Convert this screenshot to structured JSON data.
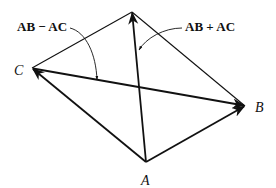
{
  "diagram": {
    "type": "vector-parallelogram",
    "vertices": {
      "A": {
        "label": "A",
        "x": 146,
        "y": 162
      },
      "B": {
        "label": "B",
        "x": 245,
        "y": 106
      },
      "C": {
        "label": "C",
        "x": 32,
        "y": 68
      },
      "D": {
        "label": "",
        "x": 132,
        "y": 12
      }
    },
    "vectors": [
      {
        "name": "AB",
        "from": "A",
        "to": "B",
        "arrow": true
      },
      {
        "name": "AC",
        "from": "A",
        "to": "C",
        "arrow": true
      },
      {
        "name": "AB + AC",
        "from": "A",
        "to": "D",
        "arrow": true
      },
      {
        "name": "AB - AC",
        "from": "C",
        "to": "B",
        "arrow": true
      }
    ],
    "edges": [
      {
        "from": "C",
        "to": "D"
      },
      {
        "from": "D",
        "to": "B"
      }
    ],
    "annotations": {
      "diff": "AB − AC",
      "sum": "AB + AC"
    },
    "colors": {
      "ink": "#111111",
      "background": "#ffffff"
    }
  }
}
